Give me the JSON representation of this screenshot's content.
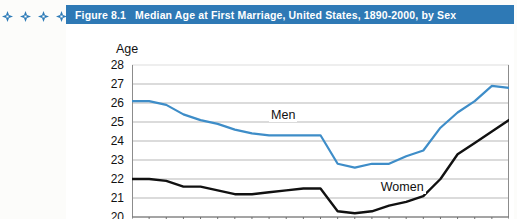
{
  "ornaments": {
    "count": 4,
    "icon": "diamond-flower-ornament",
    "color": "#2f7cb8"
  },
  "figure": {
    "number": "Figure 8.1",
    "title": "Median Age at First Marriage, United States, 1890-2000, by Sex",
    "header_color": "#2e79b5",
    "header_text_color": "#ffffff"
  },
  "chart_data": {
    "type": "line",
    "title": "Median Age at First Marriage, United States, 1890-2000, by Sex",
    "xlabel": "",
    "ylabel": "Age",
    "ylim": [
      20,
      28
    ],
    "yticks": [
      28,
      27,
      26,
      25,
      24,
      23,
      22,
      21,
      20
    ],
    "grid": true,
    "grid_axis": "y",
    "legend": "inline-labels",
    "xlim": [
      1890,
      2000
    ],
    "x": [
      1890,
      1895,
      1900,
      1905,
      1910,
      1915,
      1920,
      1925,
      1930,
      1935,
      1940,
      1945,
      1950,
      1955,
      1960,
      1965,
      1970,
      1975,
      1980,
      1985,
      1990,
      1995,
      2000
    ],
    "xtick_interval": 5,
    "xtick_labels_visible": false,
    "series": [
      {
        "name": "Men",
        "color": "#3e8dc8",
        "values": [
          26.1,
          26.1,
          25.9,
          25.4,
          25.1,
          24.9,
          24.6,
          24.4,
          24.3,
          24.3,
          24.3,
          24.3,
          22.8,
          22.6,
          22.8,
          22.8,
          23.2,
          23.5,
          24.7,
          25.5,
          26.1,
          26.9,
          26.8
        ]
      },
      {
        "name": "Women",
        "color": "#111111",
        "values": [
          22.0,
          22.0,
          21.9,
          21.6,
          21.6,
          21.4,
          21.2,
          21.2,
          21.3,
          21.4,
          21.5,
          21.5,
          20.3,
          20.2,
          20.3,
          20.6,
          20.8,
          21.1,
          22.0,
          23.3,
          23.9,
          24.5,
          25.1
        ]
      }
    ],
    "annotations": [
      {
        "text": "Men",
        "x": 1930,
        "y": 25.3
      },
      {
        "text": "Women",
        "x": 1962,
        "y": 21.55
      }
    ]
  }
}
